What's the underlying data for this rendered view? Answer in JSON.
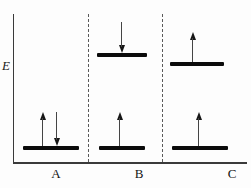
{
  "figure": {
    "type": "energy-level-spin-diagram",
    "axis_label": "E",
    "panels": [
      {
        "label": "A",
        "description": "ground state, paired spins",
        "levels": [
          {
            "position": "ground",
            "arrows": [
              "up",
              "down"
            ]
          }
        ]
      },
      {
        "label": "B",
        "description": "excited state, antiparallel spins (singlet)",
        "levels": [
          {
            "position": "excited-high",
            "arrows": [
              "down"
            ]
          },
          {
            "position": "ground",
            "arrows": [
              "up"
            ]
          }
        ]
      },
      {
        "label": "C",
        "description": "excited state, parallel spins (triplet)",
        "levels": [
          {
            "position": "excited-lower",
            "arrows": [
              "up"
            ]
          },
          {
            "position": "ground",
            "arrows": [
              "up"
            ]
          }
        ]
      }
    ],
    "colors": {
      "level_bar": "#0b0b0b",
      "axis": "#3a3a3a",
      "divider_dashed": "#5a5a5a",
      "arrow": "#161616",
      "background": "#fdfdfd"
    }
  }
}
